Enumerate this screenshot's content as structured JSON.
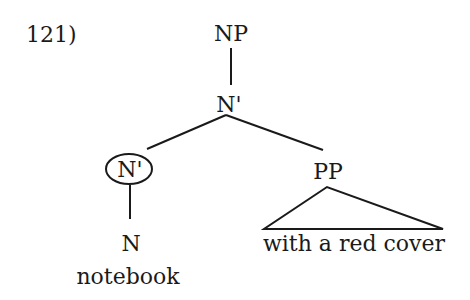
{
  "example_number": "121)",
  "tree": {
    "root": "NP",
    "nbar_top": "N'",
    "nbar_circled": "N'",
    "pp": "PP",
    "n": "N",
    "n_word": "notebook",
    "pp_words": "with a red cover"
  }
}
